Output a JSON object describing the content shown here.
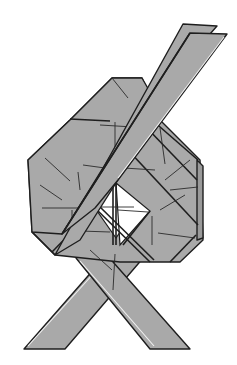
{
  "figure": {
    "type": "origami-diagram",
    "colors": {
      "paper": "#a9a9a9",
      "paper_dark": "#9a9a9a",
      "outline": "#1e1e1e",
      "background": "#ffffff",
      "window": "#ffffff"
    }
  }
}
